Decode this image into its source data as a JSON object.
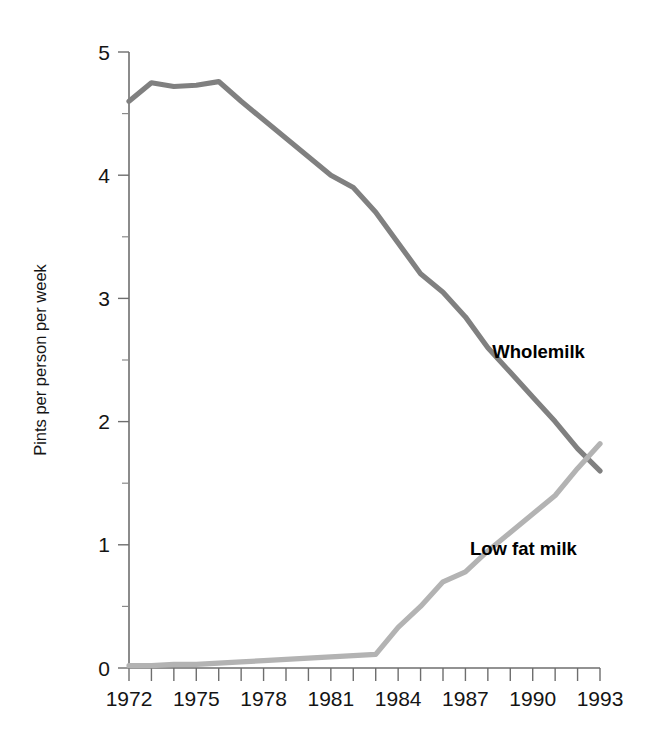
{
  "chart_data": {
    "type": "line",
    "title": "",
    "xlabel": "",
    "ylabel": "Pints per person per week",
    "xlim": [
      1972,
      1993
    ],
    "ylim": [
      0,
      5
    ],
    "grid": false,
    "legend_position": "inline-annotation",
    "y_ticks": [
      0,
      1,
      2,
      3,
      4,
      5
    ],
    "y_tick_labels": [
      "0",
      "1",
      "2",
      "3",
      "4",
      "5"
    ],
    "y_minor_ticks": [
      0.5,
      1.5,
      2.5,
      3.5,
      4.5
    ],
    "x_ticks": [
      1972,
      1973,
      1974,
      1975,
      1976,
      1977,
      1978,
      1979,
      1980,
      1981,
      1982,
      1983,
      1984,
      1985,
      1986,
      1987,
      1988,
      1989,
      1990,
      1991,
      1992,
      1993
    ],
    "x_tick_labels_shown": [
      "1972",
      "1975",
      "1978",
      "1981",
      "1984",
      "1987",
      "1990",
      "1993"
    ],
    "x": [
      1972,
      1973,
      1974,
      1975,
      1976,
      1977,
      1978,
      1979,
      1980,
      1981,
      1982,
      1983,
      1984,
      1985,
      1986,
      1987,
      1988,
      1989,
      1990,
      1991,
      1992,
      1993
    ],
    "series": [
      {
        "name": "Wholemilk",
        "color": "#808080",
        "label": "Wholemilk",
        "values": [
          4.6,
          4.75,
          4.72,
          4.73,
          4.76,
          4.6,
          4.45,
          4.3,
          4.15,
          4.0,
          3.9,
          3.7,
          3.45,
          3.2,
          3.05,
          2.85,
          2.6,
          2.4,
          2.2,
          2.0,
          1.78,
          1.6
        ]
      },
      {
        "name": "Low fat milk",
        "color": "#b3b3b3",
        "label": "Low fat milk",
        "values": [
          0.02,
          0.02,
          0.03,
          0.03,
          0.04,
          0.05,
          0.06,
          0.07,
          0.08,
          0.09,
          0.1,
          0.11,
          0.33,
          0.5,
          0.7,
          0.78,
          0.95,
          1.1,
          1.25,
          1.4,
          1.62,
          1.82
        ]
      }
    ],
    "annotations": [
      {
        "text": "Wholemilk",
        "x": 1988.2,
        "y": 2.52
      },
      {
        "text": "Low fat milk",
        "x": 1987.2,
        "y": 0.92
      }
    ]
  }
}
